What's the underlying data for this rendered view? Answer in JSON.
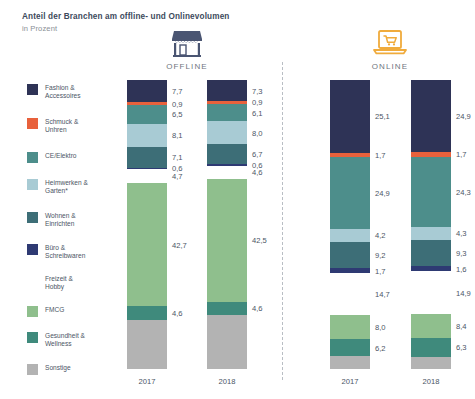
{
  "header": {
    "title": "Anteil der Branchen am offline- und Onlinevolumen",
    "subtitle": "in Prozent"
  },
  "panels": [
    {
      "id": "offline",
      "label": "OFFLINE",
      "icon": "storefront-icon",
      "icon_color": "#4a5572"
    },
    {
      "id": "online",
      "label": "ONLINE",
      "icon": "laptop-cart-icon",
      "icon_color": "#f0ab3c"
    }
  ],
  "legend": [
    {
      "label": "Fashion &\nAccessoires",
      "color": "#2e3356"
    },
    {
      "label": "Schmuck &\nUnhren",
      "color": "#e8613c"
    },
    {
      "label": "CE/Elektro",
      "color": "#4d8e8b"
    },
    {
      "label": "Heimwerken &\nGarten*",
      "color": "#a8cbd4"
    },
    {
      "label": "Wohnen &\nEinrichten",
      "color": "#3d6e77"
    },
    {
      "label": "Büro &\nSchreibwaren",
      "color": "#2e3a73"
    },
    {
      "label": "Freizeit &\nHobby",
      "color": "#f3b council"
    },
    {
      "label": "FMCG",
      "color": "#8fbf8d"
    },
    {
      "label": "Gesundheit &\nWellness",
      "color": "#3f8a7c"
    },
    {
      "label": "Sonstige",
      "color": "#b3b3b3"
    }
  ],
  "chart_data": {
    "type": "bar",
    "title": "Anteil der Branchen am offline- und Onlinevolumen",
    "subtitle": "in Prozent",
    "xlabel": "",
    "ylabel": "Prozent",
    "ylim": [
      0,
      100
    ],
    "stacked": true,
    "grid": false,
    "legend_position": "left",
    "categories": [
      "Fashion & Accessoires",
      "Schmuck & Unhren",
      "CE/Elektro",
      "Heimwerken & Garten*",
      "Wohnen & Einrichten",
      "Büro & Schreibwaren",
      "Freizeit & Hobby",
      "FMCG",
      "Gesundheit & Wellness",
      "Sonstige"
    ],
    "colors": [
      "#2e3356",
      "#e8613c",
      "#4d8e8b",
      "#a8cbd4",
      "#3d6e77",
      "#2e3a73",
      "#f3b council",
      "#8fbf8d",
      "#3f8a7c",
      "#b3b3b3"
    ],
    "series": [
      {
        "name": "OFFLINE 2017",
        "panel": "offline",
        "year": "2017",
        "values": [
          7.7,
          0.9,
          6.5,
          8.1,
          7.1,
          0.6,
          4.7,
          42.7,
          4.6,
          17.1
        ],
        "labels": [
          "7,7",
          "0,9",
          "6,5",
          "8,1",
          "7,1",
          "0,6",
          "4,7",
          "42,7",
          "4,6",
          ""
        ]
      },
      {
        "name": "OFFLINE 2018",
        "panel": "offline",
        "year": "2018",
        "values": [
          7.3,
          0.9,
          6.1,
          8.0,
          6.7,
          0.6,
          4.6,
          42.5,
          4.6,
          18.7
        ],
        "labels": [
          "7,3",
          "0,9",
          "6,1",
          "8,0",
          "6,7",
          "0,6",
          "4,6",
          "42,5",
          "4,6",
          ""
        ]
      },
      {
        "name": "ONLINE 2017",
        "panel": "online",
        "year": "2017",
        "values": [
          25.1,
          1.7,
          24.9,
          4.2,
          9.2,
          1.7,
          14.7,
          8.0,
          6.2,
          4.3
        ],
        "labels": [
          "25,1",
          "1,7",
          "24,9",
          "4,2",
          "9,2",
          "1,7",
          "14,7",
          "8,0",
          "6,2",
          ""
        ]
      },
      {
        "name": "ONLINE 2018",
        "panel": "online",
        "year": "2018",
        "values": [
          24.9,
          1.7,
          24.3,
          4.3,
          9.3,
          1.6,
          14.9,
          8.4,
          6.3,
          4.3
        ],
        "labels": [
          "24,9",
          "1,7",
          "24,3",
          "4,3",
          "9,3",
          "1,6",
          "14,9",
          "8,4",
          "6,3",
          ""
        ]
      }
    ]
  },
  "bars_layout": [
    {
      "series_index": 0,
      "left": 127,
      "year": "2017"
    },
    {
      "series_index": 1,
      "left": 207,
      "year": "2018"
    },
    {
      "series_index": 2,
      "left": 330,
      "year": "2017"
    },
    {
      "series_index": 3,
      "left": 411,
      "year": "2018"
    }
  ]
}
